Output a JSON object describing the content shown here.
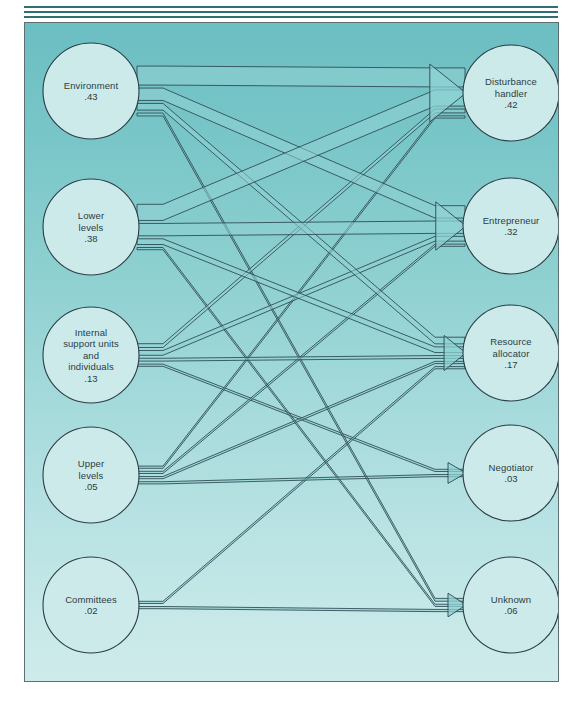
{
  "figure": {
    "type": "sankey-flow-diagram",
    "background_top_color": "#6cbec2",
    "background_bottom_color": "#cfebeb",
    "node_fill_color": "#cdeaea",
    "node_stroke_color": "#2b3d45",
    "flow_fill_color": "#8fd2d4",
    "flow_stroke_color": "#2b4750",
    "frame_color": "#5d6f72",
    "rule_color": "#2f6f74"
  },
  "sources": [
    {
      "id": "environment",
      "name": "Environment",
      "value": ".43",
      "lines": [
        "Environment",
        ".43"
      ]
    },
    {
      "id": "lower",
      "name": "Lower levels",
      "value": ".38",
      "lines": [
        "Lower",
        "levels",
        ".38"
      ]
    },
    {
      "id": "internal",
      "name": "Internal support units and individuals",
      "value": ".13",
      "lines": [
        "Internal",
        "support units",
        "and",
        "individuals",
        ".13"
      ]
    },
    {
      "id": "upper",
      "name": "Upper levels",
      "value": ".05",
      "lines": [
        "Upper",
        "levels",
        ".05"
      ]
    },
    {
      "id": "committees",
      "name": "Committees",
      "value": ".02",
      "lines": [
        "Committees",
        ".02"
      ]
    }
  ],
  "targets": [
    {
      "id": "disturbance",
      "name": "Disturbance handler",
      "value": ".42",
      "lines": [
        "Disturbance",
        "handler",
        ".42"
      ]
    },
    {
      "id": "entrepreneur",
      "name": "Entrepreneur",
      "value": ".32",
      "lines": [
        "Entrepreneur",
        ".32"
      ]
    },
    {
      "id": "resource",
      "name": "Resource allocator",
      "value": ".17",
      "lines": [
        "Resource",
        "allocator",
        ".17"
      ]
    },
    {
      "id": "negotiator",
      "name": "Negotiator",
      "value": ".03",
      "lines": [
        "Negotiator",
        ".03"
      ]
    },
    {
      "id": "unknown",
      "name": "Unknown",
      "value": ".06",
      "lines": [
        "Unknown",
        ".06"
      ]
    }
  ],
  "chart_data": {
    "type": "sankey",
    "title": "",
    "source_categories": [
      "Environment",
      "Lower levels",
      "Internal support units and individuals",
      "Upper levels",
      "Committees"
    ],
    "source_values": [
      0.43,
      0.38,
      0.13,
      0.05,
      0.02
    ],
    "target_categories": [
      "Disturbance handler",
      "Entrepreneur",
      "Resource allocator",
      "Negotiator",
      "Unknown"
    ],
    "target_values": [
      0.42,
      0.32,
      0.17,
      0.03,
      0.06
    ],
    "links": [
      {
        "source": "Environment",
        "target": "Disturbance handler",
        "value": 0.2
      },
      {
        "source": "Environment",
        "target": "Entrepreneur",
        "value": 0.13
      },
      {
        "source": "Environment",
        "target": "Resource allocator",
        "value": 0.07
      },
      {
        "source": "Environment",
        "target": "Unknown",
        "value": 0.03
      },
      {
        "source": "Lower levels",
        "target": "Disturbance handler",
        "value": 0.17
      },
      {
        "source": "Lower levels",
        "target": "Entrepreneur",
        "value": 0.13
      },
      {
        "source": "Lower levels",
        "target": "Resource allocator",
        "value": 0.06
      },
      {
        "source": "Lower levels",
        "target": "Unknown",
        "value": 0.02
      },
      {
        "source": "Internal support units and individuals",
        "target": "Disturbance handler",
        "value": 0.04
      },
      {
        "source": "Internal support units and individuals",
        "target": "Entrepreneur",
        "value": 0.05
      },
      {
        "source": "Internal support units and individuals",
        "target": "Resource allocator",
        "value": 0.03
      },
      {
        "source": "Internal support units and individuals",
        "target": "Negotiator",
        "value": 0.01
      },
      {
        "source": "Upper levels",
        "target": "Disturbance handler",
        "value": 0.01
      },
      {
        "source": "Upper levels",
        "target": "Entrepreneur",
        "value": 0.01
      },
      {
        "source": "Upper levels",
        "target": "Resource allocator",
        "value": 0.01
      },
      {
        "source": "Upper levels",
        "target": "Negotiator",
        "value": 0.02
      },
      {
        "source": "Committees",
        "target": "Resource allocator",
        "value": 0.01
      },
      {
        "source": "Committees",
        "target": "Unknown",
        "value": 0.01
      }
    ],
    "xlabel": "",
    "ylabel": "",
    "legend": []
  }
}
